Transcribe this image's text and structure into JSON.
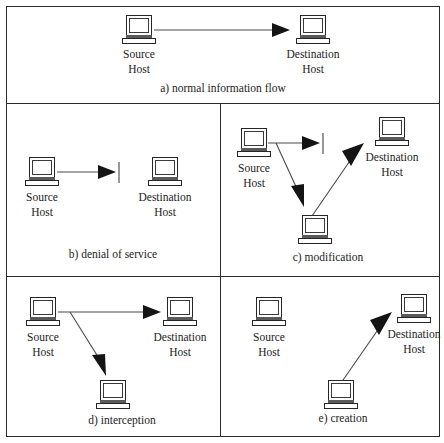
{
  "figure": {
    "layout": {
      "columns": 2,
      "rows": 3,
      "frame_color": "#2b2b2b",
      "line_color": "#4a4a4a",
      "arrowhead_color": "#141414",
      "background": "#ffffff"
    }
  },
  "node_labels": {
    "source_line1": "Source",
    "source_line2": "Host",
    "destination_line1": "Destination",
    "destination_line2": "Host"
  },
  "panels": [
    {
      "id": "a",
      "caption": "a) normal information flow",
      "nodes": [
        {
          "role": "source",
          "label_line1": "Source",
          "label_line2": "Host"
        },
        {
          "role": "destination",
          "label_line1": "Destination",
          "label_line2": "Host"
        }
      ],
      "flows": [
        {
          "from": "source",
          "to": "destination",
          "blocked": false
        }
      ]
    },
    {
      "id": "b",
      "caption": "b) denial of service",
      "nodes": [
        {
          "role": "source",
          "label_line1": "Source",
          "label_line2": "Host"
        },
        {
          "role": "destination",
          "label_line1": "Destination",
          "label_line2": "Host"
        }
      ],
      "flows": [
        {
          "from": "source",
          "to": "destination",
          "blocked": true
        }
      ]
    },
    {
      "id": "c",
      "caption": "c) modification",
      "nodes": [
        {
          "role": "source",
          "label_line1": "Source",
          "label_line2": "Host"
        },
        {
          "role": "destination",
          "label_line1": "Destination",
          "label_line2": "Host"
        },
        {
          "role": "attacker",
          "label_line1": "",
          "label_line2": ""
        }
      ],
      "flows": [
        {
          "from": "source",
          "to": "destination",
          "blocked": true
        },
        {
          "from": "source",
          "to": "attacker",
          "blocked": false
        },
        {
          "from": "attacker",
          "to": "destination",
          "blocked": false
        }
      ]
    },
    {
      "id": "d",
      "caption": "d) interception",
      "nodes": [
        {
          "role": "source",
          "label_line1": "Source",
          "label_line2": "Host"
        },
        {
          "role": "destination",
          "label_line1": "Destination",
          "label_line2": "Host"
        },
        {
          "role": "attacker",
          "label_line1": "",
          "label_line2": ""
        }
      ],
      "flows": [
        {
          "from": "source",
          "to": "destination",
          "blocked": false
        },
        {
          "from": "source",
          "to": "attacker",
          "blocked": false
        }
      ]
    },
    {
      "id": "e",
      "caption": "e) creation",
      "nodes": [
        {
          "role": "source",
          "label_line1": "Source",
          "label_line2": "Host"
        },
        {
          "role": "destination",
          "label_line1": "Destination",
          "label_line2": "Host"
        },
        {
          "role": "attacker",
          "label_line1": "",
          "label_line2": ""
        }
      ],
      "flows": [
        {
          "from": "attacker",
          "to": "destination",
          "blocked": false
        }
      ]
    }
  ]
}
